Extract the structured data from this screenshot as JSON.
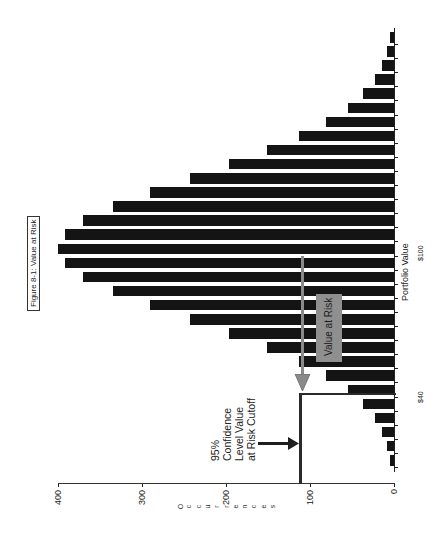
{
  "chart_data": {
    "type": "bar",
    "orientation": "histogram rendered rotated 90° counter-clockwise (bars extend left from baseline)",
    "title": "Figure 8-1:  Value at Risk",
    "xlabel": "Portfolio Value",
    "ylabel": "Occurrences",
    "x_tick_labels": [
      {
        "label": "$40",
        "bin_index": 25.5
      },
      {
        "label": "$100",
        "bin_index": 15
      }
    ],
    "y_ticks": [
      0,
      100,
      200,
      300,
      400
    ],
    "ylim": [
      0,
      400
    ],
    "grid": false,
    "legend": null,
    "categories": [
      "b1",
      "b2",
      "b3",
      "b4",
      "b5",
      "b6",
      "b7",
      "b8",
      "b9",
      "b10",
      "b11",
      "b12",
      "b13",
      "b14",
      "b15",
      "b16",
      "b17",
      "b18",
      "b19",
      "b20",
      "b21",
      "b22",
      "b23",
      "b24",
      "b25",
      "b26",
      "b27",
      "b28",
      "b29",
      "b30",
      "b31"
    ],
    "values": [
      5,
      8,
      14,
      23,
      37,
      55,
      81,
      113,
      151,
      196,
      243,
      290,
      335,
      370,
      392,
      400,
      392,
      370,
      335,
      290,
      243,
      196,
      151,
      113,
      81,
      55,
      37,
      23,
      14,
      8,
      5
    ],
    "annotations": [
      {
        "text": "95% Confidence Level Value at Risk Cutoff",
        "type": "arrow-label",
        "value": 110
      },
      {
        "text": "Value at Risk",
        "type": "shaded-box",
        "spans": "from $100 mean down to $40 cutoff"
      }
    ],
    "cutoff_line": {
      "occurrences": 110,
      "at_bin_index": 25.5
    }
  },
  "figure": {
    "title": "Figure 8-1:  Value at Risk",
    "axis": {
      "y_title": "Occurrences",
      "y_tick_labels": [
        "0",
        "100",
        "200",
        "300",
        "400"
      ],
      "x_title": "Portfolio Value",
      "x_label_mean": "$100",
      "x_label_cutoff": "$40"
    },
    "annotation": {
      "lines": [
        "95%",
        "Confidence",
        "Level Value",
        "at Risk Cutoff"
      ]
    },
    "var_label": "Value at Risk"
  },
  "colors": {
    "bar": "#141414",
    "var_box": "#8f8f8f",
    "arrow_gray": "#8a8a8a",
    "line": "#222222"
  }
}
